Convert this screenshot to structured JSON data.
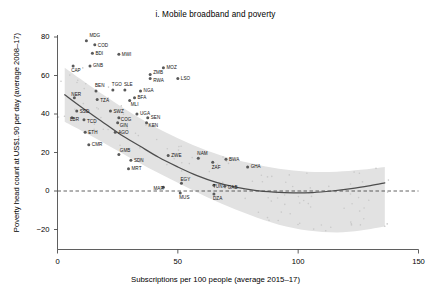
{
  "chart_data": {
    "type": "scatter",
    "title": "i. Mobile broadband and poverty",
    "xlabel": "Subscriptions per 100 people (average 2015–17)",
    "ylabel": "Poverty head count at US$1.90 per day (average 2008–17)",
    "xlim": [
      0,
      150
    ],
    "ylim": [
      -28,
      84
    ],
    "xticks": [
      0,
      50,
      100,
      150
    ],
    "xtick_labels": [
      "0",
      "50",
      "100",
      "150"
    ],
    "yticks": [
      -20,
      0,
      20,
      40,
      60,
      80
    ],
    "ytick_labels": [
      "−20",
      "0",
      "20",
      "40",
      "60",
      "80"
    ],
    "grid": false,
    "legend": false,
    "zero_reference_line": 0,
    "colors": {
      "point": "#595959",
      "trend_line": "#4d4d4d",
      "confidence_band": "#e2e2e2",
      "axis": "#4d4d4d",
      "text": "#111111"
    },
    "series": [
      {
        "name": "Countries",
        "points": [
          {
            "label": "MDG",
            "x": 12.0,
            "y": 78.0,
            "lx": 3,
            "ly": -5
          },
          {
            "label": "COD",
            "x": 15.5,
            "y": 76.0,
            "lx": 3,
            "ly": 1
          },
          {
            "label": "BDI",
            "x": 14.5,
            "y": 71.5,
            "lx": 3,
            "ly": 0
          },
          {
            "label": "MWI",
            "x": 25.5,
            "y": 71.0,
            "lx": 3,
            "ly": 0
          },
          {
            "label": "GNB",
            "x": 13.5,
            "y": 65.0,
            "lx": 3,
            "ly": 0
          },
          {
            "label": "CAP",
            "x": 6.5,
            "y": 65.0,
            "lx": -2,
            "ly": 5
          },
          {
            "label": "MOZ",
            "x": 44.0,
            "y": 64.0,
            "lx": 3,
            "ly": 0
          },
          {
            "label": "ZMB",
            "x": 38.5,
            "y": 60.5,
            "lx": 3,
            "ly": -2
          },
          {
            "label": "RWA",
            "x": 38.5,
            "y": 58.5,
            "lx": 3,
            "ly": 2
          },
          {
            "label": "LSO",
            "x": 50.0,
            "y": 58.5,
            "lx": 3,
            "ly": 0
          },
          {
            "label": "BEN",
            "x": 16.0,
            "y": 52.0,
            "lx": -1,
            "ly": -5
          },
          {
            "label": "TGO",
            "x": 23.0,
            "y": 52.5,
            "lx": -1,
            "ly": -5
          },
          {
            "label": "SLE",
            "x": 28.0,
            "y": 52.5,
            "lx": -1,
            "ly": -5
          },
          {
            "label": "NGA",
            "x": 34.5,
            "y": 52.0,
            "lx": 3,
            "ly": 0
          },
          {
            "label": "NER",
            "x": 7.0,
            "y": 48.5,
            "lx": -3,
            "ly": -3
          },
          {
            "label": "TZA",
            "x": 16.5,
            "y": 47.5,
            "lx": 3,
            "ly": 1
          },
          {
            "label": "BFA",
            "x": 32.0,
            "y": 48.5,
            "lx": 3,
            "ly": 0
          },
          {
            "label": "MLI",
            "x": 30.0,
            "y": 47.0,
            "lx": 1,
            "ly": 4
          },
          {
            "label": "SSD",
            "x": 8.0,
            "y": 41.5,
            "lx": 3,
            "ly": 0
          },
          {
            "label": "SWZ",
            "x": 22.0,
            "y": 41.5,
            "lx": 3,
            "ly": 0
          },
          {
            "label": "UGA",
            "x": 33.0,
            "y": 40.0,
            "lx": 3,
            "ly": 0
          },
          {
            "label": "LBR",
            "x": 6.0,
            "y": 38.0,
            "lx": -2,
            "ly": 2
          },
          {
            "label": "TCD",
            "x": 11.0,
            "y": 37.0,
            "lx": 3,
            "ly": 2
          },
          {
            "label": "COG",
            "x": 25.5,
            "y": 38.0,
            "lx": 2,
            "ly": 2
          },
          {
            "label": "GIN",
            "x": 25.0,
            "y": 35.5,
            "lx": 2,
            "ly": 3
          },
          {
            "label": "SEN",
            "x": 37.5,
            "y": 38.0,
            "lx": 3,
            "ly": 0
          },
          {
            "label": "KEN",
            "x": 37.0,
            "y": 35.5,
            "lx": 2,
            "ly": 3
          },
          {
            "label": "ETH",
            "x": 11.5,
            "y": 30.5,
            "lx": 3,
            "ly": 0
          },
          {
            "label": "AGO",
            "x": 24.0,
            "y": 30.5,
            "lx": 3,
            "ly": 0
          },
          {
            "label": "CMR",
            "x": 13.0,
            "y": 24.0,
            "lx": 3,
            "ly": 0
          },
          {
            "label": "GMB",
            "x": 25.5,
            "y": 19.0,
            "lx": 1,
            "ly": -4
          },
          {
            "label": "SDN",
            "x": 30.5,
            "y": 16.0,
            "lx": 3,
            "ly": 0
          },
          {
            "label": "MRT",
            "x": 29.5,
            "y": 11.5,
            "lx": 3,
            "ly": 0
          },
          {
            "label": "ZWE",
            "x": 46.0,
            "y": 18.5,
            "lx": 3,
            "ly": 0
          },
          {
            "label": "NAM",
            "x": 58.5,
            "y": 17.0,
            "lx": -1,
            "ly": -5
          },
          {
            "label": "ZAF",
            "x": 64.5,
            "y": 15.0,
            "lx": -1,
            "ly": 5
          },
          {
            "label": "BWA",
            "x": 70.0,
            "y": 16.5,
            "lx": 3,
            "ly": 0
          },
          {
            "label": "GHA",
            "x": 79.0,
            "y": 12.5,
            "lx": 3,
            "ly": 0
          },
          {
            "label": "MAR",
            "x": 44.0,
            "y": 2.0,
            "lx": -10,
            "ly": 1
          },
          {
            "label": "EGY",
            "x": 51.5,
            "y": 4.0,
            "lx": -1,
            "ly": -4
          },
          {
            "label": "MUS",
            "x": 51.0,
            "y": -1.0,
            "lx": -1,
            "ly": 5
          },
          {
            "label": "TUN",
            "x": 65.0,
            "y": 3.0,
            "lx": -1,
            "ly": 1
          },
          {
            "label": "GAB",
            "x": 69.5,
            "y": 2.5,
            "lx": 3,
            "ly": 1
          },
          {
            "label": "DZA",
            "x": 65.0,
            "y": -1.5,
            "lx": -1,
            "ly": 5
          }
        ]
      }
    ],
    "trend_line": {
      "description": "fitted quadratic trend, negative then flattening",
      "points": [
        {
          "x": 3,
          "y": 50.0
        },
        {
          "x": 10,
          "y": 43.5
        },
        {
          "x": 18,
          "y": 36.5
        },
        {
          "x": 26,
          "y": 29.5
        },
        {
          "x": 34,
          "y": 23.5
        },
        {
          "x": 42,
          "y": 17.5
        },
        {
          "x": 50,
          "y": 12.5
        },
        {
          "x": 58,
          "y": 8.0
        },
        {
          "x": 66,
          "y": 4.5
        },
        {
          "x": 74,
          "y": 2.0
        },
        {
          "x": 82,
          "y": 0.3
        },
        {
          "x": 90,
          "y": -0.6
        },
        {
          "x": 98,
          "y": -1.0
        },
        {
          "x": 106,
          "y": -0.8
        },
        {
          "x": 114,
          "y": 0.0
        },
        {
          "x": 122,
          "y": 1.2
        },
        {
          "x": 130,
          "y": 2.8
        },
        {
          "x": 136,
          "y": 4.2
        }
      ]
    },
    "confidence_band": {
      "upper": [
        {
          "x": 3,
          "y": 64.0
        },
        {
          "x": 12,
          "y": 56.0
        },
        {
          "x": 22,
          "y": 47.5
        },
        {
          "x": 32,
          "y": 39.5
        },
        {
          "x": 44,
          "y": 31.0
        },
        {
          "x": 56,
          "y": 24.0
        },
        {
          "x": 68,
          "y": 18.5
        },
        {
          "x": 80,
          "y": 14.5
        },
        {
          "x": 92,
          "y": 11.5
        },
        {
          "x": 104,
          "y": 10.0
        },
        {
          "x": 116,
          "y": 10.0
        },
        {
          "x": 126,
          "y": 11.0
        },
        {
          "x": 136,
          "y": 12.5
        }
      ],
      "lower": [
        {
          "x": 3,
          "y": 36.0
        },
        {
          "x": 12,
          "y": 30.0
        },
        {
          "x": 22,
          "y": 23.0
        },
        {
          "x": 32,
          "y": 16.0
        },
        {
          "x": 44,
          "y": 8.0
        },
        {
          "x": 56,
          "y": 0.5
        },
        {
          "x": 68,
          "y": -6.5
        },
        {
          "x": 80,
          "y": -12.5
        },
        {
          "x": 92,
          "y": -17.5
        },
        {
          "x": 104,
          "y": -20.5
        },
        {
          "x": 116,
          "y": -21.5
        },
        {
          "x": 126,
          "y": -20.5
        },
        {
          "x": 136,
          "y": -18.5
        }
      ]
    }
  }
}
